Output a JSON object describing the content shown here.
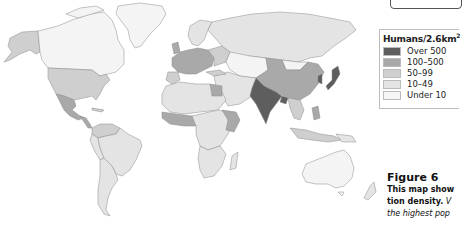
{
  "legend": {
    "title": "Humans/2.6km",
    "title_superscript": "2",
    "items": [
      {
        "label": "Over 500",
        "color": "#5e5e5e"
      },
      {
        "label": "100–500",
        "color": "#a9a9a9"
      },
      {
        "label": "50–99",
        "color": "#cfcfcf"
      },
      {
        "label": "10–49",
        "color": "#e4e4e4"
      },
      {
        "label": "Under 10",
        "color": "#f6f6f6"
      }
    ]
  },
  "caption": {
    "figure_label": "Figure 6",
    "line1": "This map show",
    "line2_bold": "tion density.",
    "line2_italic": " V",
    "line3_italic": "the highest pop"
  },
  "map": {
    "type": "choropleth world map",
    "subject": "human population density",
    "regions": [
      {
        "name": "India",
        "level": "Over 500"
      },
      {
        "name": "Bangladesh",
        "level": "Over 500"
      },
      {
        "name": "Japan",
        "level": "100–500"
      },
      {
        "name": "China",
        "level": "100–500"
      },
      {
        "name": "Western Europe",
        "level": "100–500"
      },
      {
        "name": "United States",
        "level": "50–99"
      },
      {
        "name": "Mexico",
        "level": "50–99"
      },
      {
        "name": "Russia",
        "level": "10–49"
      },
      {
        "name": "Brazil",
        "level": "10–49"
      },
      {
        "name": "Canada",
        "level": "Under 10"
      },
      {
        "name": "Greenland",
        "level": "Under 10"
      },
      {
        "name": "Australia",
        "level": "Under 10"
      }
    ]
  }
}
